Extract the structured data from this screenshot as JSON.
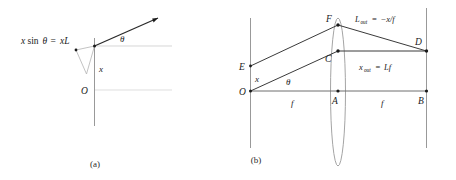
{
  "figure": {
    "background_color": "#ffffff",
    "ray_color": "#2a2a2a",
    "guide_color": "#b9b9b9",
    "axis_color": "#8d8d8d",
    "text_color": "#1a1a1a",
    "panels": [
      {
        "id": "panel-a",
        "caption": "(a)",
        "labels": {
          "equation": "x sinθ = xL",
          "equation_parts": {
            "lhs_var": "x",
            "function": "sin",
            "angle": "θ",
            "equals": "=",
            "rhs": "xL"
          },
          "angle": "θ",
          "height": "x",
          "origin": "O"
        }
      },
      {
        "id": "panel-b",
        "caption": "(b)",
        "labels": {
          "point_E": "E",
          "point_O": "O",
          "point_F": "F",
          "point_C": "C",
          "point_A": "A",
          "point_B": "B",
          "point_D": "D",
          "height_x": "x",
          "angle": "θ",
          "focal_left": "f",
          "focal_right": "f",
          "eq_top": "L_out = −x/f",
          "eq_top_parts": {
            "var": "L",
            "subscript": "out",
            "equals": "=",
            "value": "−x/f"
          },
          "eq_mid": "x_out = Lf",
          "eq_mid_parts": {
            "var": "x",
            "subscript": "out",
            "equals": "=",
            "value": "Lf"
          }
        }
      }
    ]
  }
}
